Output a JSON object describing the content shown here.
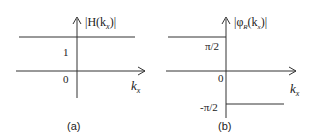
{
  "panel_a": {
    "caption": "(a)",
    "y_label": "|H(k",
    "y_label_sub": "x",
    "y_label_end": ")|",
    "x_label": "k",
    "x_label_sub": "x",
    "tick_1": "1",
    "tick_0": "0"
  },
  "panel_b": {
    "caption": "(b)",
    "y_label": "|φ",
    "y_label_sub1": "R",
    "y_label_mid": "(k",
    "y_label_sub2": "x",
    "y_label_end": ")|",
    "x_label": "k",
    "x_label_sub": "x",
    "tick_pos": "π/2",
    "tick_0": "0",
    "tick_neg": "-π/2"
  },
  "colors": {
    "line": "#333333",
    "text": "#222222",
    "background": "#ffffff"
  }
}
